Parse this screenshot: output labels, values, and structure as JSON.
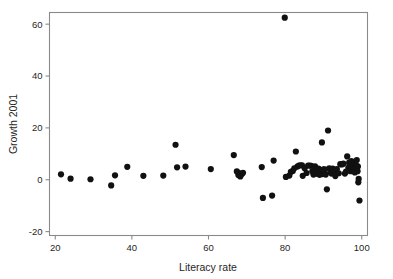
{
  "chart_data": {
    "type": "scatter",
    "title": "",
    "xlabel": "Literacy rate",
    "ylabel": "Growth 2001",
    "xlim": [
      18.5,
      101.5
    ],
    "ylim": [
      -21.5,
      64.5
    ],
    "xticks": [
      20,
      40,
      60,
      80,
      100
    ],
    "yticks": [
      -20,
      0,
      20,
      40,
      60
    ],
    "xtick_labels": [
      "20",
      "40",
      "60",
      "80",
      "100"
    ],
    "ytick_labels": [
      "-20",
      "0",
      "20",
      "40",
      "60"
    ],
    "grid": false,
    "legend": false,
    "marker": "filled-circle",
    "marker_color": "#111111",
    "marker_size": 3.1,
    "frame_color": "#8a8a8a",
    "background": "#ffffff",
    "n_points": 88,
    "points": [
      [
        21.5,
        2.1
      ],
      [
        24.0,
        0.4
      ],
      [
        29.2,
        0.2
      ],
      [
        34.6,
        -2.2
      ],
      [
        35.6,
        1.7
      ],
      [
        38.8,
        5.0
      ],
      [
        43.0,
        1.5
      ],
      [
        48.2,
        1.6
      ],
      [
        51.4,
        13.5
      ],
      [
        51.8,
        4.8
      ],
      [
        54.0,
        5.1
      ],
      [
        60.6,
        4.1
      ],
      [
        66.6,
        9.5
      ],
      [
        67.4,
        3.2
      ],
      [
        67.8,
        1.8
      ],
      [
        68.0,
        2.6
      ],
      [
        68.3,
        1.3
      ],
      [
        68.7,
        2.2
      ],
      [
        69.0,
        2.7
      ],
      [
        73.9,
        4.9
      ],
      [
        74.2,
        -7.0
      ],
      [
        76.6,
        -6.1
      ],
      [
        77.0,
        7.4
      ],
      [
        79.9,
        62.5
      ],
      [
        80.2,
        1.1
      ],
      [
        81.1,
        1.6
      ],
      [
        81.5,
        3.0
      ],
      [
        82.0,
        3.4
      ],
      [
        82.4,
        4.4
      ],
      [
        82.8,
        10.9
      ],
      [
        83.2,
        5.1
      ],
      [
        83.6,
        5.5
      ],
      [
        84.0,
        5.6
      ],
      [
        84.4,
        5.6
      ],
      [
        84.6,
        1.5
      ],
      [
        85.1,
        4.4
      ],
      [
        85.6,
        2.6
      ],
      [
        86.0,
        5.5
      ],
      [
        86.4,
        5.5
      ],
      [
        86.8,
        5.4
      ],
      [
        87.1,
        3.3
      ],
      [
        87.4,
        2.0
      ],
      [
        87.8,
        5.2
      ],
      [
        88.2,
        3.5
      ],
      [
        88.4,
        2.3
      ],
      [
        88.7,
        4.3
      ],
      [
        89.0,
        1.9
      ],
      [
        89.3,
        3.6
      ],
      [
        89.6,
        14.4
      ],
      [
        89.8,
        2.2
      ],
      [
        90.0,
        4.0
      ],
      [
        90.3,
        4.0
      ],
      [
        90.6,
        2.0
      ],
      [
        90.9,
        -3.7
      ],
      [
        91.2,
        19.0
      ],
      [
        91.5,
        4.4
      ],
      [
        91.8,
        3.0
      ],
      [
        92.1,
        2.4
      ],
      [
        92.4,
        4.3
      ],
      [
        92.7,
        3.2
      ],
      [
        93.1,
        1.4
      ],
      [
        93.5,
        4.1
      ],
      [
        94.0,
        2.5
      ],
      [
        94.4,
        6.0
      ],
      [
        94.8,
        5.9
      ],
      [
        95.2,
        6.2
      ],
      [
        95.6,
        2.4
      ],
      [
        95.9,
        3.1
      ],
      [
        96.2,
        9.0
      ],
      [
        96.5,
        4.6
      ],
      [
        96.7,
        6.6
      ],
      [
        96.9,
        5.8
      ],
      [
        97.1,
        3.3
      ],
      [
        97.3,
        7.2
      ],
      [
        97.5,
        5.0
      ],
      [
        97.7,
        4.4
      ],
      [
        97.9,
        6.3
      ],
      [
        98.0,
        3.9
      ],
      [
        98.2,
        2.8
      ],
      [
        98.4,
        5.6
      ],
      [
        98.5,
        4.6
      ],
      [
        98.7,
        7.6
      ],
      [
        98.8,
        5.3
      ],
      [
        98.9,
        3.3
      ],
      [
        99.0,
        5.1
      ],
      [
        99.1,
        -1.0
      ],
      [
        99.2,
        0.3
      ],
      [
        99.4,
        -8.0
      ]
    ]
  },
  "figure": {
    "xlabel_text": "Literacy rate",
    "ylabel_text": "Growth 2001"
  }
}
